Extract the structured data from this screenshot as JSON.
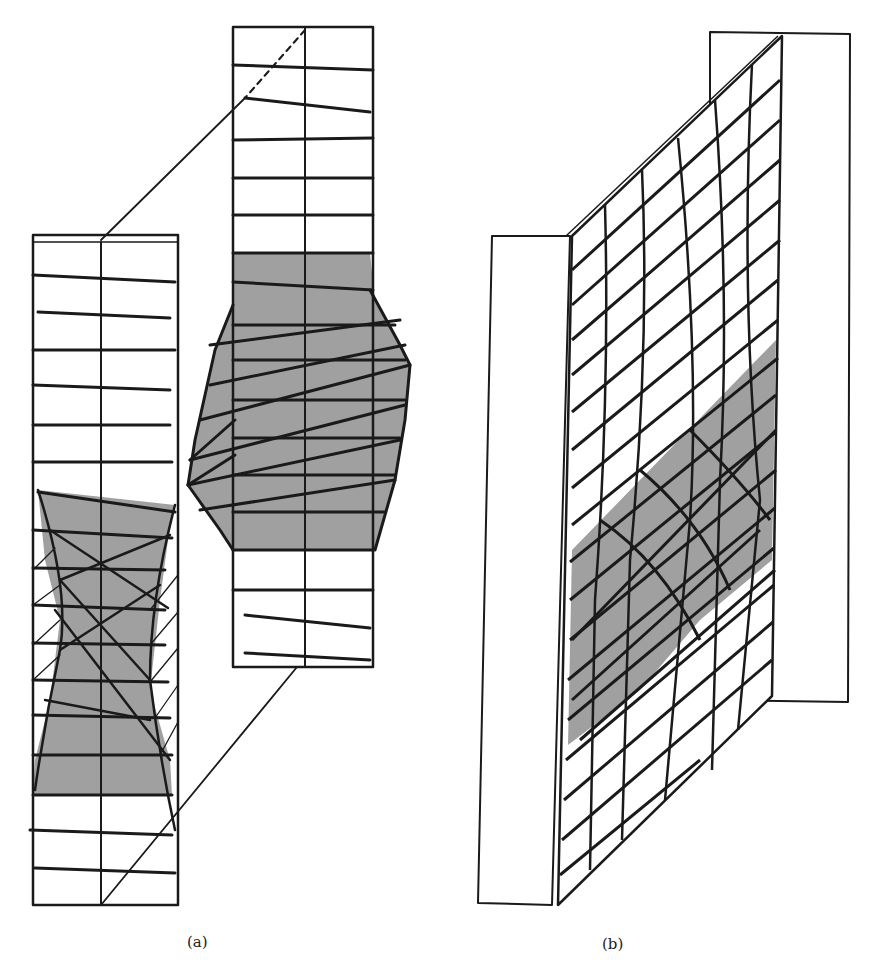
{
  "figure": {
    "panels": [
      {
        "id": "a",
        "caption": "(a)",
        "description": "Two vertical strips of a finite element mesh; left strip shows a shaded necking (hourglass) region, right enlarged strip shows shaded bulging region with diagonal element distortion; connected by projection lines"
      },
      {
        "id": "b",
        "caption": "(b)",
        "description": "Perspective view of a deformed mesh panel between two rigid plates, with a shaded diagonal band of distorted elements"
      }
    ],
    "colors": {
      "line": "#1a1a1a",
      "shade": "#a0a0a0",
      "background": "#ffffff"
    }
  }
}
